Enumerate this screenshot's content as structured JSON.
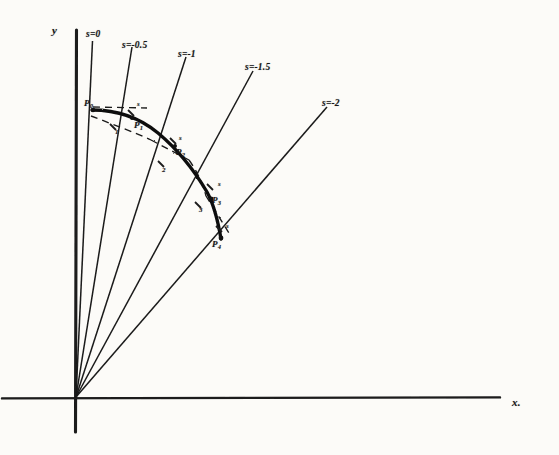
{
  "figure": {
    "background_color": "#fcfbf8",
    "ink_color": "#1a1a1a"
  },
  "axes": {
    "y_label": "y",
    "x_label": "x.",
    "origin": {
      "x": 76,
      "y": 397
    },
    "y_axis": {
      "x": 76,
      "y_top": 30,
      "y_bottom": 432
    },
    "x_axis": {
      "y": 398,
      "x_left": 2,
      "x_right": 500
    }
  },
  "rays": [
    {
      "label": "s=0",
      "angle_label": "s=0",
      "end_x": 92,
      "end_y": 42
    },
    {
      "label": "s=-0.5",
      "angle_label": "s=-0.5",
      "end_x": 132,
      "end_y": 48
    },
    {
      "label": "s=-1",
      "angle_label": "s=-1",
      "end_x": 186,
      "end_y": 58
    },
    {
      "label": "s=-1.5",
      "angle_label": "s=-1.5",
      "end_x": 253,
      "end_y": 72
    },
    {
      "label": "s=-2",
      "angle_label": "s=-2",
      "end_x": 327,
      "end_y": 108
    }
  ],
  "ray_labels": [
    {
      "text": "s=0",
      "x": 86,
      "y": 30
    },
    {
      "text": "s=-0.5",
      "x": 122,
      "y": 40
    },
    {
      "text": "s=-1",
      "x": 178,
      "y": 49
    },
    {
      "text": "s=-1.5",
      "x": 245,
      "y": 62
    },
    {
      "text": "s=-2",
      "x": 322,
      "y": 98
    }
  ],
  "curve_points": [
    {
      "name": "P0",
      "base": "P",
      "sub": "0",
      "x": 93,
      "y": 110,
      "label_x": 85,
      "label_y": 100
    },
    {
      "name": "P1",
      "base": "P",
      "sub": "1",
      "x": 132,
      "y": 119,
      "label_x": 134,
      "label_y": 121
    },
    {
      "name": "P2",
      "base": "P",
      "sub": "2",
      "x": 175,
      "y": 145,
      "label_x": 176,
      "label_y": 148
    },
    {
      "name": "P3",
      "base": "P",
      "sub": "3",
      "x": 213,
      "y": 194,
      "label_x": 212,
      "label_y": 196
    },
    {
      "name": "P4",
      "base": "P",
      "sub": "4",
      "x": 221,
      "y": 238,
      "label_x": 213,
      "label_y": 240
    }
  ],
  "curve": {
    "description": "solid heavy arc through P0..P4",
    "path": "M 93,110 C 118,110 140,118 158,133 C 176,148 194,170 207,192 C 213,203 218,221 221,238"
  },
  "dashed_chords": [
    {
      "from": "P0",
      "path": "M 93,108 L 144,108"
    },
    {
      "from": "P0-low",
      "path": "M 92,115 C 118,123 140,132 150,138"
    },
    {
      "from": "P1",
      "path": "M 150,138 L 187,158"
    },
    {
      "from": "P2",
      "path": "M 187,158 C 196,168 203,183 206,195"
    },
    {
      "from": "P3",
      "path": "M 206,195 L 227,231"
    }
  ],
  "tick_marks": [
    {
      "x": 131,
      "y": 113
    },
    {
      "x": 113,
      "y": 127
    },
    {
      "x": 173,
      "y": 141
    },
    {
      "x": 161,
      "y": 164
    },
    {
      "x": 210,
      "y": 187
    },
    {
      "x": 198,
      "y": 205
    },
    {
      "x": 219,
      "y": 229
    }
  ],
  "tick_label_texts": [
    {
      "text": "s",
      "x": 139,
      "y": 103
    },
    {
      "text": "1",
      "x": 116,
      "y": 130
    },
    {
      "text": "s",
      "x": 180,
      "y": 136
    },
    {
      "text": "2",
      "x": 163,
      "y": 168
    },
    {
      "text": "s",
      "x": 219,
      "y": 182
    },
    {
      "text": "3",
      "x": 200,
      "y": 208
    },
    {
      "text": "s",
      "x": 227,
      "y": 224
    }
  ]
}
